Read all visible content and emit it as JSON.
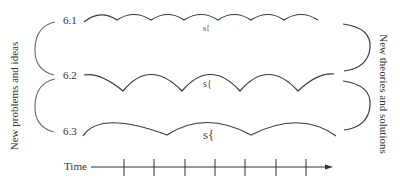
{
  "diagram": {
    "rows": [
      {
        "label": "6.1",
        "scallops": 7,
        "symbol": "s{",
        "y": 20
      },
      {
        "label": "6.2",
        "scallops": 5,
        "symbol": "s{",
        "y": 75
      },
      {
        "label": "6.3",
        "scallops": 3,
        "symbol": "s{",
        "y": 130
      }
    ],
    "left_axis_label": "New problems and ideas",
    "right_axis_label": "New theories  and solutions",
    "time_axis": {
      "label": "Time",
      "ticks": 7
    }
  }
}
